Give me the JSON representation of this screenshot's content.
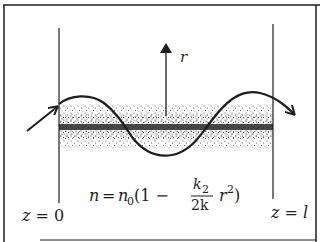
{
  "diagram": {
    "type": "graded-index fiber / lens-like medium ray propagation",
    "labels": {
      "axis_label": "r",
      "left_plane": "z = 0",
      "right_plane": "z = l"
    },
    "formula": {
      "lhs": "n",
      "equals": "=",
      "n0": "n",
      "n0_sub": "0",
      "open": "(1 −",
      "frac_num": "k",
      "frac_num_sub": "2",
      "frac_den": "2k",
      "r": "r",
      "r_sup": "2",
      "close": ")"
    },
    "colors": {
      "ink": "#1e1e1e",
      "stipple": "#3a3a3a",
      "background": "#ffffff"
    }
  }
}
